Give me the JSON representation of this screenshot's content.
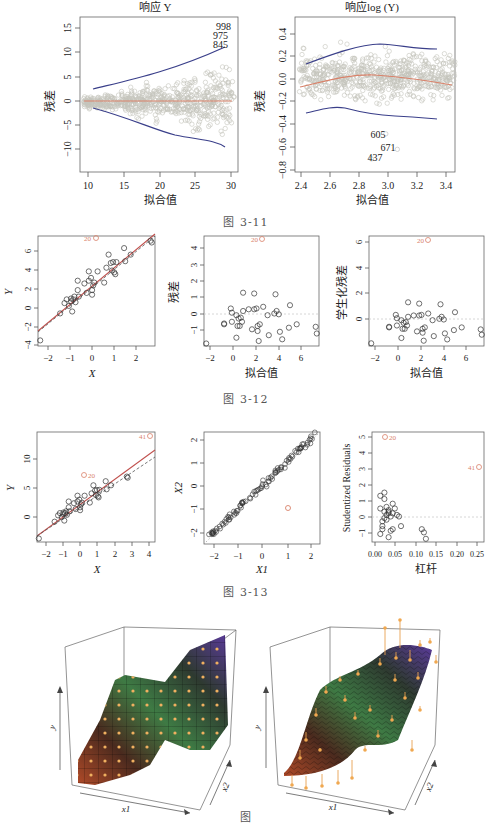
{
  "figures": [
    {
      "id": "3-11",
      "caption": "图   3-11"
    },
    {
      "id": "3-12",
      "caption": "图   3-12"
    },
    {
      "id": "3-13",
      "caption": "图   3-13"
    },
    {
      "id": "3-14",
      "caption": "图"
    }
  ],
  "labels": {
    "p1_title": "响应 Y",
    "p1_ylabel": "残差",
    "p1_xlabel": "拟合值",
    "p1_ann": [
      "998",
      "975",
      "845"
    ],
    "p2_title": "响应log (Y)",
    "p2_ylabel": "残差",
    "p2_xlabel": "拟合值",
    "p2_ann": [
      "605",
      "671",
      "437"
    ],
    "p3_ylabel": "Y",
    "p3_xlabel": "X",
    "p3_ann": "20",
    "p4_ylabel": "残差",
    "p4_xlabel": "拟合值",
    "p4_ann": "20",
    "p5_ylabel": "学生化残差",
    "p5_xlabel": "拟合值",
    "p5_ann": "20",
    "p6_ylabel": "Y",
    "p6_xlabel": "X",
    "p6_ann": [
      "41",
      "20"
    ],
    "p7_ylabel": "X2",
    "p7_xlabel": "X1",
    "p8_ylabel": "Studentized Residuals",
    "p8_xlabel": "杠杆",
    "p8_ann": [
      "20",
      "41"
    ],
    "p9_axes": [
      "y",
      "x1",
      "x2"
    ],
    "p10_axes": [
      "y",
      "x1",
      "x2"
    ]
  },
  "colors": {
    "points": "#b8b8b0",
    "smooth_blue": "#3a3f8a",
    "smooth_red": "#d9826a",
    "highlight": "#d9826a",
    "black": "#333333"
  },
  "chart_data": [
    {
      "type": "scatter",
      "title": "响应 Y",
      "xlabel": "拟合值",
      "ylabel": "残差",
      "xlim": [
        9.5,
        30.5
      ],
      "ylim": [
        -14,
        17
      ],
      "xticks": [
        10,
        15,
        20,
        25,
        30
      ],
      "yticks": [
        -10,
        -5,
        0,
        5,
        10,
        15
      ],
      "annotations": [
        {
          "label": "998",
          "x": 29,
          "y": 15
        },
        {
          "label": "975",
          "x": 28.8,
          "y": 13.4
        },
        {
          "label": "845",
          "x": 28.8,
          "y": 11.8
        }
      ],
      "smooth_upper": {
        "x": [
          11,
          15,
          20,
          25,
          29
        ],
        "y": [
          2.5,
          3.8,
          5.8,
          8.3,
          11
        ]
      },
      "smooth_lower": {
        "x": [
          11,
          15,
          20,
          25,
          29
        ],
        "y": [
          -1.5,
          -3.5,
          -6.5,
          -7.3,
          -7.8
        ]
      },
      "smooth_center": {
        "x": [
          10,
          30
        ],
        "y": [
          0,
          0
        ]
      }
    },
    {
      "type": "scatter",
      "title": "响应log (Y)",
      "xlabel": "拟合值",
      "ylabel": "残差",
      "xlim": [
        2.37,
        3.48
      ],
      "ylim": [
        -0.8,
        0.5
      ],
      "xticks": [
        2.4,
        2.6,
        2.8,
        3.0,
        3.2,
        3.4
      ],
      "yticks": [
        -0.8,
        -0.6,
        -0.4,
        -0.2,
        0.0,
        0.2,
        0.4
      ],
      "annotations": [
        {
          "label": "605",
          "x": 2.98,
          "y": -0.5
        },
        {
          "label": "671",
          "x": 3.05,
          "y": -0.62
        },
        {
          "label": "437",
          "x": 2.93,
          "y": -0.71
        }
      ],
      "smooth_upper": {
        "x": [
          2.45,
          2.7,
          2.95,
          3.2,
          3.42
        ],
        "y": [
          0.12,
          0.24,
          0.3,
          0.27,
          0.26
        ]
      },
      "smooth_lower": {
        "x": [
          2.45,
          2.65,
          2.9,
          3.2,
          3.42
        ],
        "y": [
          -0.29,
          -0.25,
          -0.3,
          -0.33,
          -0.34
        ]
      },
      "smooth_center": {
        "x": [
          2.4,
          2.7,
          2.95,
          3.2,
          3.48
        ],
        "y": [
          -0.05,
          0.01,
          0.04,
          0.0,
          -0.05
        ]
      }
    },
    {
      "type": "scatter",
      "xlabel": "X",
      "ylabel": "Y",
      "xlim": [
        -2.4,
        2.9
      ],
      "ylim": [
        -4.5,
        7.3
      ],
      "xticks": [
        -2,
        -1,
        0,
        1,
        2
      ],
      "yticks": [
        -4,
        -2,
        0,
        2,
        4,
        6
      ],
      "points": {
        "x": [
          -2.3,
          -1.4,
          -1.2,
          -1.1,
          -1.0,
          -0.9,
          -0.9,
          -0.85,
          -0.8,
          -0.75,
          -0.7,
          -0.6,
          -0.6,
          -0.55,
          -0.3,
          -0.2,
          -0.1,
          -0.1,
          0.0,
          0.05,
          0.05,
          0.1,
          0.15,
          0.3,
          0.6,
          0.7,
          0.8,
          0.9,
          0.95,
          1.0,
          1.05,
          1.1,
          1.15,
          1.5,
          1.55,
          1.8,
          2.7,
          2.75
        ],
        "y": [
          -3.9,
          -1.0,
          0.1,
          0.5,
          -0.2,
          0.6,
          0.3,
          -0.8,
          0.5,
          0.8,
          0.2,
          2.5,
          1.5,
          0.8,
          2.2,
          1.2,
          3.5,
          2.5,
          2.8,
          1.5,
          1.0,
          2.0,
          2.3,
          3.5,
          2.3,
          3.9,
          5.3,
          4.4,
          3.6,
          4.5,
          3.4,
          3.2,
          4.5,
          6.0,
          4.6,
          5.3,
          6.8,
          6.6
        ]
      },
      "highlight": {
        "label": "20",
        "x": 0.2,
        "y": 7.1
      },
      "lines": [
        {
          "name": "fit",
          "intercept": 2.0,
          "slope": 1.9
        }
      ]
    },
    {
      "type": "scatter",
      "xlabel": "拟合值",
      "ylabel": "残差",
      "xlim": [
        -2.5,
        7.8
      ],
      "ylim": [
        -1.7,
        4.9
      ],
      "xticks": [
        -2,
        0,
        2,
        4,
        6
      ],
      "yticks": [
        -1,
        0,
        1,
        2,
        3,
        4
      ],
      "points": {
        "x": [
          -2.3,
          -0.7,
          -0.7,
          0.0,
          -0.1,
          0.0,
          0.4,
          0.4,
          0.5,
          0.6,
          0.7,
          0.8,
          0.9,
          1.0,
          1.0,
          1.5,
          1.8,
          2.0,
          2.0,
          2.2,
          2.3,
          2.3,
          2.4,
          2.5,
          2.8,
          3.2,
          3.3,
          3.8,
          3.9,
          4.0,
          4.2,
          4.3,
          4.5,
          5.1,
          5.2,
          5.8,
          7.5,
          7.6
        ],
        "y": [
          -1.55,
          -0.35,
          -0.4,
          -0.25,
          0.55,
          0.3,
          -1.2,
          0.15,
          -0.5,
          -0.05,
          -0.5,
          0.0,
          -0.25,
          1.5,
          0.4,
          0.5,
          -0.7,
          1.45,
          0.5,
          0.55,
          -0.8,
          -0.5,
          -1.4,
          -0.4,
          0.65,
          0.15,
          -1.05,
          0.25,
          1.4,
          0.4,
          0.2,
          -0.85,
          -1.3,
          -0.6,
          0.75,
          -0.4,
          -0.55,
          -0.95
        ]
      },
      "highlight": {
        "label": "20",
        "x": 2.5,
        "y": 4.7
      }
    },
    {
      "type": "scatter",
      "xlabel": "拟合值",
      "ylabel": "学生化残差",
      "xlim": [
        -2.5,
        7.8
      ],
      "ylim": [
        -1.8,
        6.5
      ],
      "xticks": [
        -2,
        0,
        2,
        4,
        6
      ],
      "yticks": [
        0,
        2,
        4,
        6
      ],
      "points": {
        "x": [
          -2.3,
          -0.7,
          -0.7,
          0.0,
          -0.1,
          0.0,
          0.4,
          0.4,
          0.5,
          0.6,
          0.7,
          0.8,
          0.9,
          1.0,
          1.0,
          1.5,
          1.8,
          2.0,
          2.0,
          2.2,
          2.3,
          2.3,
          2.4,
          2.5,
          2.8,
          3.2,
          3.3,
          3.8,
          3.9,
          4.0,
          4.2,
          4.3,
          4.5,
          5.1,
          5.2,
          5.8,
          7.5,
          7.6
        ],
        "y": [
          -1.6,
          -0.35,
          -0.4,
          -0.25,
          0.55,
          0.3,
          -1.2,
          0.15,
          -0.5,
          -0.05,
          -0.5,
          0.0,
          -0.25,
          1.5,
          0.4,
          0.5,
          -0.7,
          1.4,
          0.5,
          0.55,
          -0.8,
          -0.5,
          -1.4,
          -0.4,
          0.65,
          0.15,
          -1.05,
          0.25,
          1.35,
          0.4,
          0.2,
          -0.85,
          -1.3,
          -0.6,
          0.75,
          -0.4,
          -0.55,
          -0.95
        ]
      },
      "highlight": {
        "label": "20",
        "x": 2.5,
        "y": 6.15
      }
    },
    {
      "type": "scatter",
      "xlabel": "X",
      "ylabel": "Y",
      "xlim": [
        -2.4,
        4.3
      ],
      "ylim": [
        -4.5,
        14.5
      ],
      "xticks": [
        -2,
        -1,
        0,
        1,
        2,
        3,
        4
      ],
      "yticks": [
        0,
        5,
        10
      ],
      "points": {
        "x": [
          -2.3,
          -1.4,
          -1.2,
          -1.1,
          -1.0,
          -0.9,
          -0.9,
          -0.85,
          -0.8,
          -0.75,
          -0.7,
          -0.6,
          -0.6,
          -0.55,
          -0.3,
          -0.2,
          -0.1,
          -0.1,
          0.0,
          0.05,
          0.05,
          0.1,
          0.15,
          0.3,
          0.6,
          0.7,
          0.8,
          0.9,
          0.95,
          1.0,
          1.05,
          1.1,
          1.15,
          1.5,
          1.55,
          1.8,
          2.7,
          2.75
        ],
        "y": [
          -3.9,
          -1.0,
          0.1,
          0.5,
          -0.2,
          0.6,
          0.3,
          -0.8,
          0.5,
          0.8,
          0.2,
          2.5,
          1.5,
          0.8,
          2.2,
          1.2,
          3.5,
          2.5,
          2.8,
          1.5,
          1.0,
          2.0,
          2.3,
          3.5,
          2.3,
          3.9,
          5.3,
          4.4,
          3.6,
          4.5,
          3.4,
          3.2,
          4.5,
          6.0,
          4.6,
          5.3,
          6.8,
          6.6
        ]
      },
      "highlights": [
        {
          "label": "41",
          "x": 4.1,
          "y": 14.0
        },
        {
          "label": "20",
          "x": 0.2,
          "y": 7.3
        }
      ],
      "lines": [
        {
          "name": "fit_all",
          "style": "solid",
          "intercept": 2.3,
          "slope": 2.2
        },
        {
          "name": "fit_excl",
          "style": "dashed",
          "intercept": 2.0,
          "slope": 1.9
        }
      ]
    },
    {
      "type": "scatter",
      "xlabel": "X1",
      "ylabel": "X2",
      "xlim": [
        -2.4,
        2.4
      ],
      "ylim": [
        -2.5,
        2.3
      ],
      "xticks": [
        -2,
        -1,
        0,
        1,
        2
      ],
      "yticks": [
        -2,
        -1,
        0,
        1,
        2
      ],
      "points_note": "~100 points tightly along X2 ≈ X1",
      "highlight": {
        "x": 1.0,
        "y": -1.0
      },
      "reference_line": {
        "intercept": 0,
        "slope": 1,
        "style": "dotted"
      }
    },
    {
      "type": "scatter",
      "xlabel": "杠杆",
      "ylabel": "Studentized Residuals",
      "xlim": [
        0,
        0.27
      ],
      "ylim": [
        -1.7,
        5.2
      ],
      "xticks": [
        0.0,
        0.05,
        0.1,
        0.15,
        0.2,
        0.25
      ],
      "yticks": [
        -1,
        0,
        1,
        2,
        3,
        4,
        5
      ],
      "points": {
        "x": [
          0.02,
          0.02,
          0.025,
          0.025,
          0.03,
          0.03,
          0.03,
          0.035,
          0.035,
          0.035,
          0.04,
          0.04,
          0.04,
          0.045,
          0.045,
          0.05,
          0.05,
          0.055,
          0.06,
          0.065,
          0.07,
          0.02,
          0.025,
          0.03,
          0.04,
          0.05,
          0.12,
          0.125,
          0.13
        ],
        "y": [
          1.2,
          0.4,
          -0.4,
          -0.7,
          1.4,
          1.0,
          0.2,
          0.0,
          -0.3,
          0.5,
          0.3,
          -1.4,
          0.1,
          -1.0,
          -0.1,
          0.7,
          -0.9,
          0.4,
          0.0,
          -0.1,
          -0.7,
          -1.2,
          -0.9,
          -0.2,
          0.2,
          0.1,
          -0.9,
          -1.1,
          -1.5
        ]
      },
      "highlights": [
        {
          "label": "20",
          "x": 0.025,
          "y": 4.9
        },
        {
          "label": "41",
          "x": 0.26,
          "y": 3.1
        }
      ]
    },
    {
      "type": "surface3d",
      "style": "step",
      "axes": [
        "x1",
        "x2",
        "y"
      ],
      "colormap": [
        "#b04a28",
        "#3e7a44",
        "#5a3a9a"
      ]
    },
    {
      "type": "surface3d",
      "style": "smooth",
      "axes": [
        "x1",
        "x2",
        "y"
      ],
      "colormap": [
        "#b04a28",
        "#3e7a44",
        "#5a3a9a"
      ],
      "points_with_stems": true
    }
  ]
}
